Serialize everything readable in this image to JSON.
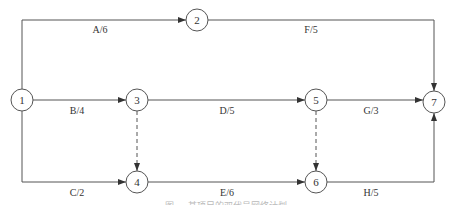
{
  "diagram": {
    "type": "activity-on-arrow network",
    "nodes": [
      {
        "id": "1",
        "label": "1"
      },
      {
        "id": "2",
        "label": "2"
      },
      {
        "id": "3",
        "label": "3"
      },
      {
        "id": "4",
        "label": "4"
      },
      {
        "id": "5",
        "label": "5"
      },
      {
        "id": "6",
        "label": "6"
      },
      {
        "id": "7",
        "label": "7"
      }
    ],
    "edges": [
      {
        "from": "1",
        "to": "2",
        "label": "A/6",
        "style": "solid"
      },
      {
        "from": "2",
        "to": "7",
        "label": "F/5",
        "style": "solid"
      },
      {
        "from": "1",
        "to": "3",
        "label": "B/4",
        "style": "solid"
      },
      {
        "from": "3",
        "to": "5",
        "label": "D/5",
        "style": "solid"
      },
      {
        "from": "5",
        "to": "7",
        "label": "G/3",
        "style": "solid"
      },
      {
        "from": "1",
        "to": "4",
        "label": "C/2",
        "style": "solid"
      },
      {
        "from": "4",
        "to": "6",
        "label": "E/6",
        "style": "solid"
      },
      {
        "from": "6",
        "to": "7",
        "label": "H/5",
        "style": "solid"
      },
      {
        "from": "3",
        "to": "4",
        "label": "",
        "style": "dashed"
      },
      {
        "from": "5",
        "to": "6",
        "label": "",
        "style": "dashed"
      }
    ],
    "caption": "图 … 某项目的双代号网络计划"
  }
}
